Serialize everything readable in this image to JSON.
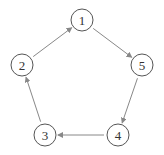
{
  "diagram": {
    "type": "directed-cycle",
    "nodes": [
      {
        "id": "1",
        "label": "1",
        "x": 82,
        "y": 20
      },
      {
        "id": "2",
        "label": "2",
        "x": 22,
        "y": 65
      },
      {
        "id": "3",
        "label": "3",
        "x": 45,
        "y": 135
      },
      {
        "id": "4",
        "label": "4",
        "x": 118,
        "y": 135
      },
      {
        "id": "5",
        "label": "5",
        "x": 142,
        "y": 65
      }
    ],
    "edges": [
      {
        "from": "1",
        "to": "5"
      },
      {
        "from": "5",
        "to": "4"
      },
      {
        "from": "4",
        "to": "3"
      },
      {
        "from": "3",
        "to": "2"
      },
      {
        "from": "2",
        "to": "1"
      }
    ],
    "colors": {
      "node_stroke": "#555555",
      "edge": "#888888",
      "text": "#333333"
    }
  }
}
